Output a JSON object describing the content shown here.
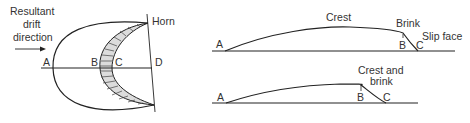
{
  "plan_view": {
    "drift_label_line1": "Resultant",
    "drift_label_line2": "drift",
    "drift_label_line3": "direction",
    "horn": "Horn",
    "points": {
      "a": "A",
      "b": "B",
      "c": "C",
      "d": "D"
    }
  },
  "profile_top": {
    "crest": "Crest",
    "brink": "Brink",
    "slip_face": "Slip face",
    "points": {
      "a": "A",
      "b": "B",
      "c": "C"
    }
  },
  "profile_bottom": {
    "crest_brink_line1": "Crest and",
    "crest_brink_line2": "brink",
    "points": {
      "a": "A",
      "b": "B",
      "c": "C"
    }
  },
  "colors": {
    "line": "#222222",
    "hatch_fill": "#dcdcdc",
    "text": "#333333"
  }
}
